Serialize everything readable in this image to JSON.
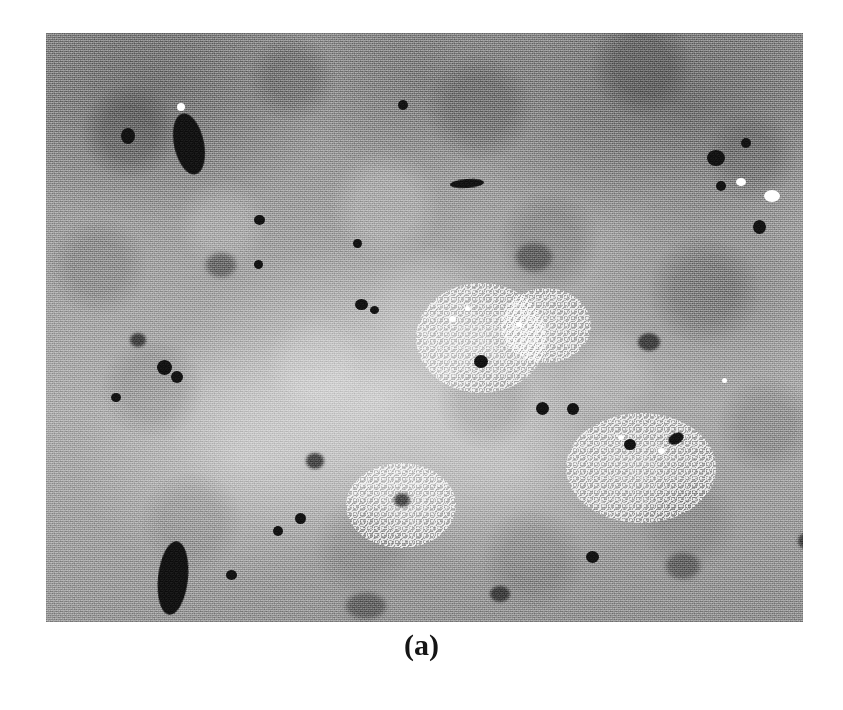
{
  "figure": {
    "caption": "(a)",
    "panel_label": "a",
    "kind": "micrograph",
    "modality": "grayscale-electron-micrograph",
    "alt_description": "Grayscale micrograph showing a mottled granular microstructure with scattered dark inclusions, elongated dark particles and bright speckled clusters."
  },
  "colors": {
    "page_background": "#ffffff",
    "micrograph_mid_tone": "#a3a3a3",
    "micrograph_light_tone": "#c4c4c4",
    "micrograph_dark_tone": "#707070",
    "inclusion_black": "#111111",
    "speck_white": "#ffffff",
    "caption_text": "#151515"
  },
  "micrograph": {
    "frame": {
      "x": 46,
      "y": 33,
      "width": 757,
      "height": 589
    },
    "inclusions": [
      {
        "x": 128,
        "y": 80,
        "w": 30,
        "h": 62,
        "rot": -12,
        "type": "solid",
        "name": "large-dark-particle-top-left"
      },
      {
        "x": 75,
        "y": 95,
        "w": 14,
        "h": 16,
        "rot": 0,
        "type": "solid",
        "name": "dark-particle"
      },
      {
        "x": 112,
        "y": 508,
        "w": 30,
        "h": 74,
        "rot": 6,
        "type": "solid",
        "name": "large-dark-particle-bottom-left"
      },
      {
        "x": 404,
        "y": 146,
        "w": 34,
        "h": 9,
        "rot": -4,
        "type": "solid",
        "name": "dark-streak-top-center"
      },
      {
        "x": 352,
        "y": 67,
        "w": 10,
        "h": 10,
        "rot": 0,
        "type": "solid",
        "name": "dark-particle"
      },
      {
        "x": 208,
        "y": 182,
        "w": 11,
        "h": 10,
        "rot": 0,
        "type": "solid",
        "name": "dark-particle"
      },
      {
        "x": 307,
        "y": 206,
        "w": 9,
        "h": 9,
        "rot": 0,
        "type": "solid",
        "name": "dark-particle"
      },
      {
        "x": 309,
        "y": 266,
        "w": 13,
        "h": 11,
        "rot": 0,
        "type": "solid",
        "name": "dark-particle"
      },
      {
        "x": 324,
        "y": 273,
        "w": 9,
        "h": 8,
        "rot": 0,
        "type": "solid",
        "name": "dark-particle"
      },
      {
        "x": 111,
        "y": 327,
        "w": 15,
        "h": 15,
        "rot": 0,
        "type": "solid",
        "name": "dark-particle"
      },
      {
        "x": 125,
        "y": 338,
        "w": 12,
        "h": 12,
        "rot": 0,
        "type": "solid",
        "name": "dark-particle"
      },
      {
        "x": 65,
        "y": 360,
        "w": 10,
        "h": 9,
        "rot": 0,
        "type": "solid",
        "name": "dark-particle"
      },
      {
        "x": 428,
        "y": 322,
        "w": 14,
        "h": 13,
        "rot": 0,
        "type": "solid",
        "name": "dark-particle"
      },
      {
        "x": 490,
        "y": 369,
        "w": 13,
        "h": 13,
        "rot": 0,
        "type": "solid",
        "name": "dark-particle"
      },
      {
        "x": 521,
        "y": 370,
        "w": 12,
        "h": 12,
        "rot": 0,
        "type": "solid",
        "name": "dark-particle"
      },
      {
        "x": 578,
        "y": 406,
        "w": 12,
        "h": 11,
        "rot": 0,
        "type": "solid",
        "name": "dark-particle"
      },
      {
        "x": 622,
        "y": 400,
        "w": 16,
        "h": 11,
        "rot": -28,
        "type": "solid",
        "name": "dark-particle"
      },
      {
        "x": 661,
        "y": 117,
        "w": 18,
        "h": 16,
        "rot": 0,
        "type": "solid",
        "name": "dark-particle"
      },
      {
        "x": 695,
        "y": 105,
        "w": 10,
        "h": 10,
        "rot": 0,
        "type": "solid",
        "name": "dark-particle"
      },
      {
        "x": 789,
        "y": 153,
        "w": 15,
        "h": 14,
        "rot": 0,
        "type": "solid",
        "name": "dark-particle"
      },
      {
        "x": 707,
        "y": 187,
        "w": 13,
        "h": 14,
        "rot": 0,
        "type": "solid",
        "name": "dark-particle"
      },
      {
        "x": 670,
        "y": 148,
        "w": 10,
        "h": 10,
        "rot": 0,
        "type": "solid",
        "name": "dark-particle"
      },
      {
        "x": 208,
        "y": 227,
        "w": 9,
        "h": 9,
        "rot": 0,
        "type": "solid",
        "name": "dark-particle"
      },
      {
        "x": 249,
        "y": 480,
        "w": 11,
        "h": 11,
        "rot": 0,
        "type": "solid",
        "name": "dark-particle"
      },
      {
        "x": 180,
        "y": 537,
        "w": 11,
        "h": 10,
        "rot": 0,
        "type": "solid",
        "name": "dark-particle"
      },
      {
        "x": 227,
        "y": 493,
        "w": 10,
        "h": 10,
        "rot": 0,
        "type": "solid",
        "name": "dark-particle"
      },
      {
        "x": 540,
        "y": 518,
        "w": 13,
        "h": 12,
        "rot": 0,
        "type": "solid",
        "name": "dark-particle"
      },
      {
        "x": 84,
        "y": 300,
        "w": 16,
        "h": 14,
        "rot": 0,
        "type": "soft",
        "name": "dark-particle-soft"
      },
      {
        "x": 260,
        "y": 420,
        "w": 18,
        "h": 16,
        "rot": 0,
        "type": "soft",
        "name": "dark-particle-soft"
      },
      {
        "x": 348,
        "y": 460,
        "w": 16,
        "h": 14,
        "rot": 0,
        "type": "soft",
        "name": "dark-particle-soft"
      },
      {
        "x": 444,
        "y": 553,
        "w": 20,
        "h": 16,
        "rot": 0,
        "type": "soft",
        "name": "dark-particle-soft"
      },
      {
        "x": 592,
        "y": 300,
        "w": 22,
        "h": 18,
        "rot": 0,
        "type": "soft",
        "name": "dark-particle-soft"
      },
      {
        "x": 752,
        "y": 500,
        "w": 18,
        "h": 16,
        "rot": 0,
        "type": "soft",
        "name": "dark-particle-soft"
      },
      {
        "x": 160,
        "y": 220,
        "w": 30,
        "h": 24,
        "rot": 0,
        "type": "faint",
        "name": "dark-patch-faint"
      },
      {
        "x": 470,
        "y": 210,
        "w": 36,
        "h": 28,
        "rot": 0,
        "type": "faint",
        "name": "dark-patch-faint"
      },
      {
        "x": 620,
        "y": 520,
        "w": 34,
        "h": 26,
        "rot": 0,
        "type": "faint",
        "name": "dark-patch-faint"
      },
      {
        "x": 300,
        "y": 560,
        "w": 40,
        "h": 26,
        "rot": 0,
        "type": "faint",
        "name": "dark-patch-faint"
      }
    ],
    "bright_specks": [
      {
        "x": 131,
        "y": 70,
        "w": 8,
        "h": 8,
        "name": "bright-speck"
      },
      {
        "x": 690,
        "y": 145,
        "w": 10,
        "h": 8,
        "name": "bright-speck"
      },
      {
        "x": 718,
        "y": 157,
        "w": 16,
        "h": 12,
        "name": "bright-speck-large"
      },
      {
        "x": 403,
        "y": 283,
        "w": 7,
        "h": 6,
        "name": "bright-speck"
      },
      {
        "x": 419,
        "y": 273,
        "w": 5,
        "h": 5,
        "name": "bright-speck"
      },
      {
        "x": 470,
        "y": 289,
        "w": 6,
        "h": 5,
        "name": "bright-speck"
      },
      {
        "x": 572,
        "y": 402,
        "w": 6,
        "h": 5,
        "name": "bright-speck"
      },
      {
        "x": 612,
        "y": 415,
        "w": 7,
        "h": 6,
        "name": "bright-speck"
      },
      {
        "x": 186,
        "y": 600,
        "w": 6,
        "h": 5,
        "name": "bright-speck"
      },
      {
        "x": 355,
        "y": 610,
        "w": 6,
        "h": 5,
        "name": "bright-speck"
      },
      {
        "x": 676,
        "y": 345,
        "w": 5,
        "h": 5,
        "name": "bright-speck"
      }
    ],
    "speckle_clusters": [
      {
        "x": 370,
        "y": 250,
        "w": 130,
        "h": 110,
        "name": "bright-speckle-cluster-center"
      },
      {
        "x": 455,
        "y": 255,
        "w": 90,
        "h": 75,
        "name": "bright-speckle-cluster-center-right"
      },
      {
        "x": 520,
        "y": 380,
        "w": 150,
        "h": 110,
        "name": "bright-speckle-cluster-lower-right"
      },
      {
        "x": 300,
        "y": 430,
        "w": 110,
        "h": 85,
        "name": "bright-speckle-cluster-lower-center"
      }
    ]
  }
}
